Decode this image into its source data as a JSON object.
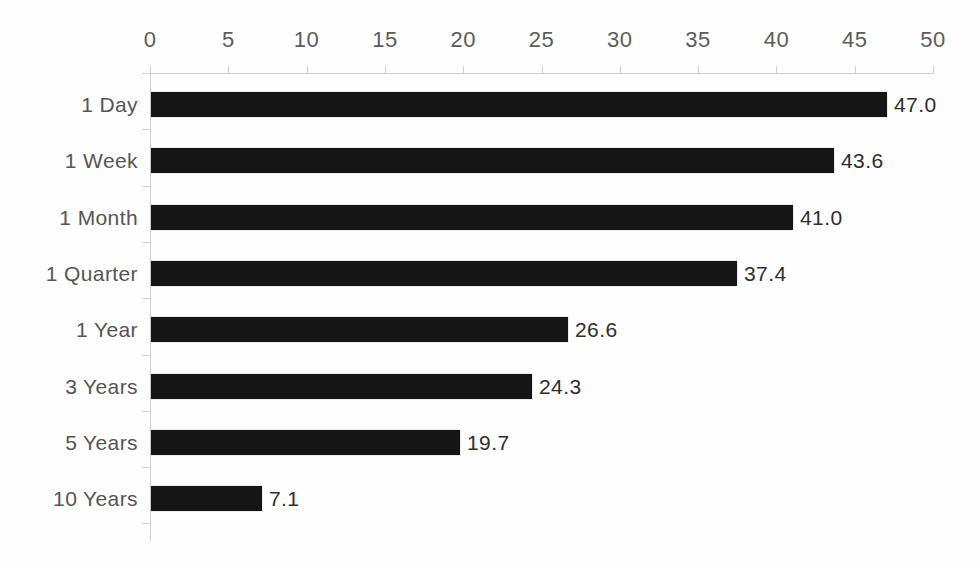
{
  "chart_data": {
    "type": "bar",
    "orientation": "horizontal",
    "title": "",
    "subtitle": "",
    "xlabel": "",
    "ylabel": "",
    "xlim": [
      0,
      50
    ],
    "grid": false,
    "legend": "none",
    "axis_position": "top",
    "categories": [
      "1 Day",
      "1 Week",
      "1 Month",
      "1 Quarter",
      "1 Year",
      "3 Years",
      "5 Years",
      "10 Years"
    ],
    "values": [
      47.0,
      43.6,
      41.0,
      37.4,
      26.6,
      24.3,
      19.7,
      7.1
    ],
    "value_labels": [
      "47.0",
      "43.6",
      "41.0",
      "37.4",
      "26.6",
      "24.3",
      "19.7",
      "7.1"
    ],
    "xticks": [
      0,
      5,
      10,
      15,
      20,
      25,
      30,
      35,
      40,
      45,
      50
    ],
    "xtick_labels": [
      "0",
      "5",
      "10",
      "15",
      "20",
      "25",
      "30",
      "35",
      "40",
      "45",
      "50"
    ],
    "colors": {
      "bar": "#151515",
      "background": "#ffffff",
      "axis": "#cfcfcf",
      "tick_label": "#5c5c5c",
      "category_label": "#555555",
      "value_label": "#2e2e2e"
    }
  }
}
